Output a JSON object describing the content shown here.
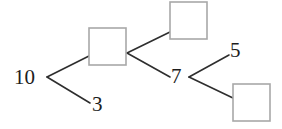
{
  "diagram": {
    "type": "number-bond-decomposition-tree",
    "root_value": "10",
    "canvas": {
      "width": 282,
      "height": 129,
      "background": "#ffffff"
    },
    "colors": {
      "line": "#2e2e2e",
      "box_border": "#a8a8a8",
      "box_fill": "#ffffff",
      "text": "#1d1d1d"
    },
    "nodes": [
      {
        "id": "root",
        "kind": "number",
        "label": "10",
        "x": 14,
        "y": 67
      },
      {
        "id": "branch-1-top",
        "kind": "empty-box",
        "label": "",
        "x": 89,
        "y": 28,
        "width": 37,
        "height": 37
      },
      {
        "id": "branch-1-bottom",
        "kind": "number",
        "label": "3",
        "x": 92,
        "y": 94
      },
      {
        "id": "branch-2-top",
        "kind": "empty-box",
        "label": "",
        "x": 170,
        "y": 2,
        "width": 37,
        "height": 37
      },
      {
        "id": "branch-2-bottom",
        "kind": "number",
        "label": "7",
        "x": 171,
        "y": 66
      },
      {
        "id": "branch-3-top",
        "kind": "number",
        "label": "5",
        "x": 230,
        "y": 40
      },
      {
        "id": "branch-3-bottom",
        "kind": "empty-box",
        "label": "",
        "x": 233,
        "y": 84,
        "width": 37,
        "height": 37
      }
    ],
    "edges": [
      {
        "id": "edge-root-up",
        "from": "root",
        "to": "branch-1-top",
        "x1": 47,
        "y1": 77,
        "x2": 89,
        "y2": 56
      },
      {
        "id": "edge-root-down",
        "from": "root",
        "to": "branch-1-bottom",
        "x1": 47,
        "y1": 77,
        "x2": 90,
        "y2": 103
      },
      {
        "id": "edge-mid-up",
        "from": "branch-1-top",
        "to": "branch-2-top",
        "x1": 127,
        "y1": 53,
        "x2": 170,
        "y2": 32
      },
      {
        "id": "edge-mid-down",
        "from": "branch-1-top",
        "to": "branch-2-bottom",
        "x1": 127,
        "y1": 53,
        "x2": 170,
        "y2": 77
      },
      {
        "id": "edge-right-up",
        "from": "branch-2-bottom",
        "to": "branch-3-top",
        "x1": 189,
        "y1": 77,
        "x2": 229,
        "y2": 55
      },
      {
        "id": "edge-right-down",
        "from": "branch-2-bottom",
        "to": "branch-3-bottom",
        "x1": 189,
        "y1": 77,
        "x2": 233,
        "y2": 98
      }
    ],
    "semantics": {
      "relations": [
        "10 = [box] + 3",
        "[box] = [box] + 7",
        "7 = 5 + [box]"
      ]
    }
  }
}
